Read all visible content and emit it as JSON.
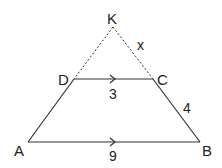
{
  "diagram": {
    "type": "trapezoid-with-extended-sides",
    "vertices": {
      "K": "K",
      "D": "D",
      "C": "C",
      "A": "A",
      "B": "B"
    },
    "measurements": {
      "DC": "3",
      "AB": "9",
      "CB": "4",
      "KC": "x"
    },
    "notes": {
      "parallel": "DC ∥ AB (arrow marks)",
      "dashed": "KD and KC are dashed extensions"
    },
    "colors": {
      "line": "#333333",
      "text": "#222222",
      "background": "#ffffff"
    }
  }
}
